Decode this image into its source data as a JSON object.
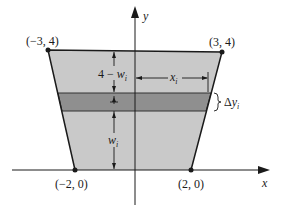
{
  "figure": {
    "type": "region-with-horizontal-strip",
    "axes": {
      "x_label": "x",
      "y_label": "y"
    },
    "points": [
      {
        "label": "(−3, 4)",
        "x": -3,
        "y": 4
      },
      {
        "label": "(3, 4)",
        "x": 3,
        "y": 4
      },
      {
        "label": "(−2, 0)",
        "x": -2,
        "y": 0
      },
      {
        "label": "(2, 0)",
        "x": 2,
        "y": 0
      }
    ],
    "annotations": {
      "top_gap": {
        "prefix": "4 − ",
        "var": "w",
        "sub": "i"
      },
      "bottom_gap": {
        "var": "w",
        "sub": "i"
      },
      "strip_length": {
        "var": "x",
        "sub": "i"
      },
      "strip_width": {
        "prefix": "Δ",
        "var": "y",
        "sub": "i"
      }
    },
    "colors": {
      "region_fill": "#c9c9c9",
      "strip_fill": "#8f8f8f",
      "lines": "#1a1a1a",
      "background": "#ffffff"
    }
  }
}
